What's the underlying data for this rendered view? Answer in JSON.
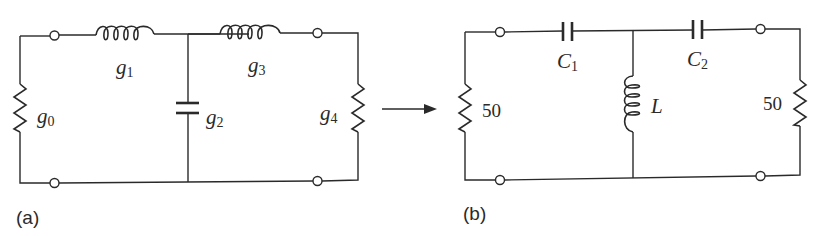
{
  "figure": {
    "panels": [
      {
        "id": "a",
        "caption": "(a)",
        "components": [
          {
            "type": "resistor",
            "label": "g",
            "sub": "0",
            "position": "left shunt"
          },
          {
            "type": "inductor",
            "label": "g",
            "sub": "1",
            "position": "series top"
          },
          {
            "type": "capacitor",
            "label": "g",
            "sub": "2",
            "position": "middle shunt"
          },
          {
            "type": "inductor",
            "label": "g",
            "sub": "3",
            "position": "series top"
          },
          {
            "type": "resistor",
            "label": "g",
            "sub": "4",
            "position": "right shunt"
          }
        ]
      },
      {
        "id": "b",
        "caption": "(b)",
        "components": [
          {
            "type": "resistor",
            "label": "50",
            "position": "left shunt"
          },
          {
            "type": "capacitor",
            "label": "C",
            "sub": "1",
            "position": "series top"
          },
          {
            "type": "inductor",
            "label": "L",
            "position": "middle shunt"
          },
          {
            "type": "capacitor",
            "label": "C",
            "sub": "2",
            "position": "series top"
          },
          {
            "type": "resistor",
            "label": "50",
            "position": "right shunt"
          }
        ]
      }
    ],
    "arrow": {
      "direction": "right"
    }
  }
}
